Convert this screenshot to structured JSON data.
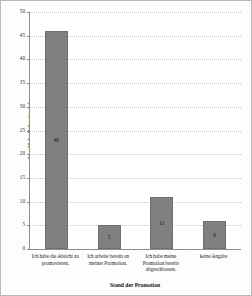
{
  "chart_data": {
    "type": "bar",
    "title": "",
    "xlabel": "Stand der Promotion",
    "ylabel": "Anzahl der Befragten (n)",
    "categories": [
      "Ich habe die Absicht zu promovieren.",
      "Ich arbeite bereits an meiner Promotion.",
      "Ich habe meine Promotion bereits abgeschlossen.",
      "keine Angabe"
    ],
    "values": [
      46,
      5,
      11,
      6
    ],
    "value_labels": [
      "46",
      "5",
      "11",
      "6"
    ],
    "ylim": [
      0,
      50
    ],
    "ytick_labels": [
      "0",
      "5",
      "10",
      "15",
      "20",
      "25",
      "30",
      "35",
      "40",
      "45",
      "50"
    ],
    "yticks": [
      0,
      5,
      10,
      15,
      20,
      25,
      30,
      35,
      40,
      45,
      50
    ],
    "grid": true,
    "legend": false,
    "colors": {
      "bar_fill": "#808080",
      "bar_stroke": "#6e6e6e",
      "gridline": "#c4c4c4",
      "axis": "#8c8c8c",
      "text": "#1a1a1a",
      "background": "#fdfdfd",
      "frame_border": "#b9b9b9"
    }
  }
}
